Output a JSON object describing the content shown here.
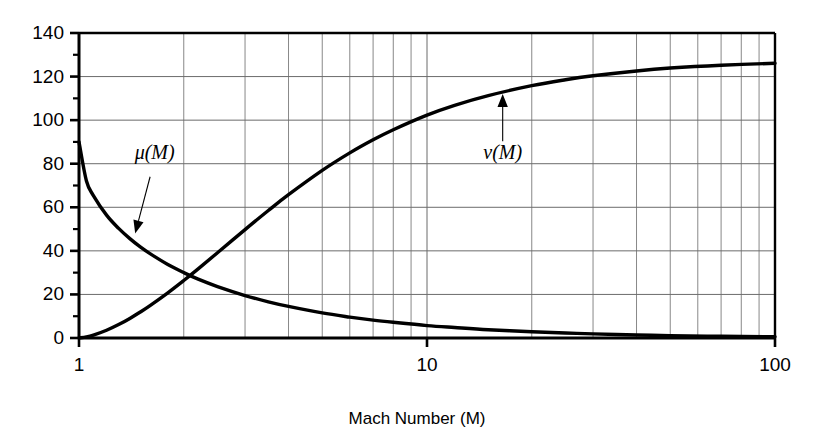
{
  "chart_data": {
    "type": "line",
    "title": "",
    "xlabel": "Mach Number (M)",
    "ylabel": "",
    "xscale": "log",
    "xlim": [
      1,
      100
    ],
    "ylim": [
      0,
      140
    ],
    "grid": true,
    "legend_position": "inline-annotations",
    "x_tick_labels": [
      "1",
      "10",
      "100"
    ],
    "x_tick_values": [
      1,
      10,
      100
    ],
    "y_tick_labels": [
      "0",
      "20",
      "40",
      "60",
      "80",
      "100",
      "120",
      "140"
    ],
    "y_tick_values": [
      0,
      20,
      40,
      60,
      80,
      100,
      120,
      140
    ],
    "y_minor_tick_values": [
      10,
      30,
      50,
      70,
      90,
      110,
      130
    ],
    "x_minor_tick_values": [
      2,
      3,
      4,
      5,
      6,
      7,
      8,
      9,
      20,
      30,
      40,
      50,
      60,
      70,
      80,
      90
    ],
    "annotations": [
      {
        "name": "mu-label",
        "text": "μ(M)",
        "x_value": 1.65,
        "y_value": 82,
        "arrow_to_x": 1.45,
        "arrow_to_y": 48
      },
      {
        "name": "nu-label",
        "text": "ν(M)",
        "x_value": 16.5,
        "y_value": 82,
        "arrow_to_x": 16.5,
        "arrow_to_y": 112
      }
    ],
    "series": [
      {
        "name": "μ(M)",
        "description": "Mach angle, degrees",
        "x": [
          1,
          1.05,
          1.1,
          1.2,
          1.3,
          1.4,
          1.5,
          1.6,
          1.8,
          2,
          2.2,
          2.5,
          3,
          3.5,
          4,
          5,
          6,
          7,
          8,
          10,
          12,
          15,
          20,
          25,
          30,
          40,
          50,
          70,
          100
        ],
        "values": [
          90,
          72.2,
          65.4,
          56.4,
          50.3,
          45.6,
          41.8,
          38.7,
          33.7,
          30,
          27,
          23.6,
          19.5,
          16.6,
          14.5,
          11.5,
          9.6,
          8.2,
          7.2,
          5.7,
          4.8,
          3.8,
          2.9,
          2.3,
          1.9,
          1.4,
          1.1,
          0.8,
          0.6
        ]
      },
      {
        "name": "ν(M)",
        "description": "Prandtl-Meyer function, degrees",
        "x": [
          1,
          1.05,
          1.1,
          1.2,
          1.3,
          1.4,
          1.5,
          1.6,
          1.8,
          2,
          2.2,
          2.5,
          3,
          3.5,
          4,
          5,
          6,
          7,
          8,
          10,
          12,
          15,
          20,
          25,
          30,
          40,
          50,
          70,
          100
        ],
        "values": [
          0,
          0.49,
          1.34,
          3.56,
          6.17,
          8.99,
          11.91,
          14.86,
          20.73,
          26.38,
          31.73,
          39.12,
          49.76,
          58.53,
          65.78,
          76.92,
          84.96,
          90.97,
          95.62,
          102.32,
          106.81,
          111.27,
          115.82,
          118.55,
          120.35,
          122.58,
          123.9,
          125.2,
          126.1
        ]
      }
    ]
  },
  "axes": {
    "x_axis_title": "Mach Number (M)"
  }
}
